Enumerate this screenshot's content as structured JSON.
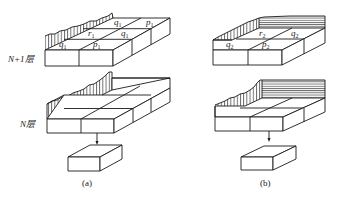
{
  "figure": {
    "layer_labels": {
      "upper": "N+1层",
      "lower": "N层"
    },
    "panels": [
      {
        "caption": "(a)",
        "upper_grid_labels": [
          {
            "sym": "q",
            "sub": "1",
            "pos": "back-left"
          },
          {
            "sym": "p",
            "sub": "1",
            "pos": "back-right"
          },
          {
            "sym": "r",
            "sub": "1",
            "pos": "middle-left"
          },
          {
            "sym": "q",
            "sub": "1",
            "pos": "middle-right"
          },
          {
            "sym": "q",
            "sub": "1",
            "pos": "front-left"
          },
          {
            "sym": "p",
            "sub": "1",
            "pos": "front-right"
          }
        ],
        "boundary_style": "vertical hatch on left edge"
      },
      {
        "caption": "(b)",
        "upper_grid_labels": [
          {
            "sym": "r",
            "sub": "2",
            "pos": "back-left"
          },
          {
            "sym": "q",
            "sub": "2",
            "pos": "back-right"
          },
          {
            "sym": "q",
            "sub": "2",
            "pos": "front-left"
          },
          {
            "sym": "p",
            "sub": "2",
            "pos": "front-right"
          }
        ],
        "boundary_style": "vertical hatch on left edge, horizontal hatch on back edge"
      }
    ]
  }
}
